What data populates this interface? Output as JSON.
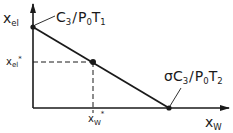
{
  "diagram": {
    "type": "phase-line",
    "y_axis": {
      "label_main": "x",
      "label_sub": "el"
    },
    "x_axis": {
      "label_main": "x",
      "label_sub": "W"
    },
    "y_marker": {
      "label_main": "x",
      "label_sub": "el",
      "label_sup": "*"
    },
    "x_marker": {
      "label_main": "x",
      "label_sub": "W",
      "label_sup": "*"
    },
    "top_point_label": {
      "a": "C",
      "a_sub": "3",
      "slash": "/",
      "b": "P",
      "b_sub": "0",
      "c": "T",
      "c_sub": "1"
    },
    "right_point_label": {
      "prefix": "σ",
      "a": "C",
      "a_sub": "3",
      "slash": "/",
      "b": "P",
      "b_sub": "0",
      "c": "T",
      "c_sub": "2"
    },
    "line": {
      "start": {
        "x_w": 0,
        "x_el": "C3/P0T1"
      },
      "end": {
        "x_w": "σC3/P0T2",
        "x_el": 0
      },
      "operating_point": {
        "x_w": "xW*",
        "x_el": "xel*"
      }
    }
  }
}
